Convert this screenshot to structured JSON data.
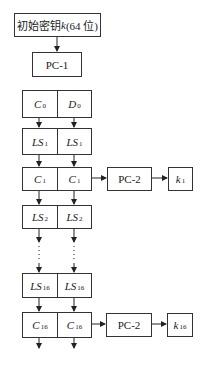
{
  "diagram": {
    "initial_key": {
      "prefix": "初始密钥",
      "var": "k",
      "suffix": "(64 位)"
    },
    "pc1_label": "PC-1",
    "pc2_label": "PC-2",
    "rows": [
      {
        "id": "c0d0",
        "left": {
          "base": "C",
          "sub": "0"
        },
        "right": {
          "base": "D",
          "sub": "0"
        }
      },
      {
        "id": "ls1",
        "left": {
          "base": "LS",
          "sub": "1"
        },
        "right": {
          "base": "LS",
          "sub": "1"
        }
      },
      {
        "id": "c1",
        "left": {
          "base": "C",
          "sub": "1"
        },
        "right": {
          "base": "C",
          "sub": "1"
        }
      },
      {
        "id": "ls2",
        "left": {
          "base": "LS",
          "sub": "2"
        },
        "right": {
          "base": "LS",
          "sub": "2"
        }
      },
      {
        "id": "ls16",
        "left": {
          "base": "LS",
          "sub": "16"
        },
        "right": {
          "base": "LS",
          "sub": "16"
        }
      },
      {
        "id": "c16",
        "left": {
          "base": "C",
          "sub": "16"
        },
        "right": {
          "base": "C",
          "sub": "16"
        }
      }
    ],
    "outputs": [
      {
        "base": "k",
        "sub": "1"
      },
      {
        "base": "k",
        "sub": "16"
      }
    ],
    "ellipsis": "⋮"
  }
}
